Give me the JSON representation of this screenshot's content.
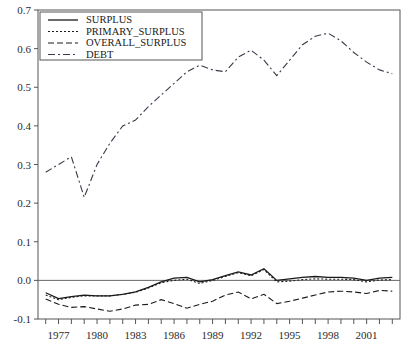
{
  "chart_data": {
    "type": "line",
    "title": "",
    "xlabel": "",
    "ylabel": "",
    "xlim": [
      1975.4,
      2003.6
    ],
    "ylim": [
      -0.1,
      0.7
    ],
    "grid": false,
    "legend_position": "top-left",
    "y_ticks": [
      "0.7",
      "0.6",
      "0.5",
      "0.4",
      "0.3",
      "0.2",
      "0.1",
      "0.0",
      "-0.1"
    ],
    "y_tick_values": [
      0.7,
      0.6,
      0.5,
      0.4,
      0.3,
      0.2,
      0.1,
      0.0,
      -0.1
    ],
    "x_tick_labels": [
      "1977",
      "1980",
      "1983",
      "1986",
      "1989",
      "1992",
      "1995",
      "1998",
      "2001"
    ],
    "x_tick_values": [
      1977,
      1980,
      1983,
      1986,
      1989,
      1992,
      1995,
      1998,
      2001
    ],
    "x_minor_ticks": [
      1976,
      1977,
      1978,
      1979,
      1980,
      1981,
      1982,
      1983,
      1984,
      1985,
      1986,
      1987,
      1988,
      1989,
      1990,
      1991,
      1992,
      1993,
      1994,
      1995,
      1996,
      1997,
      1998,
      1999,
      2000,
      2001,
      2002,
      2003
    ],
    "x": [
      1976,
      1977,
      1978,
      1979,
      1980,
      1981,
      1982,
      1983,
      1984,
      1985,
      1986,
      1987,
      1988,
      1989,
      1990,
      1991,
      1992,
      1993,
      1994,
      1995,
      1996,
      1997,
      1998,
      1999,
      2000,
      2001,
      2002,
      2003
    ],
    "zero_line": 0.0,
    "series": [
      {
        "name": "SURPLUS",
        "style": "solid",
        "color": "#1a1a1a",
        "values": [
          -0.032,
          -0.047,
          -0.042,
          -0.038,
          -0.04,
          -0.04,
          -0.036,
          -0.03,
          -0.018,
          -0.004,
          0.006,
          0.008,
          -0.004,
          0.002,
          0.012,
          0.022,
          0.014,
          0.03,
          0.0,
          0.004,
          0.008,
          0.01,
          0.008,
          0.008,
          0.006,
          0.0,
          0.006,
          0.008
        ]
      },
      {
        "name": "PRIMARY_SURPLUS",
        "style": "dotted",
        "color": "#1a1a1a",
        "values": [
          -0.038,
          -0.05,
          -0.044,
          -0.04,
          -0.04,
          -0.04,
          -0.036,
          -0.031,
          -0.02,
          -0.006,
          0.0,
          0.003,
          -0.008,
          0.0,
          0.01,
          0.02,
          0.012,
          0.028,
          -0.004,
          -0.002,
          0.002,
          0.004,
          0.003,
          0.003,
          0.002,
          -0.004,
          0.001,
          0.002
        ]
      },
      {
        "name": "OVERALL_SURPLUS",
        "style": "dashed",
        "color": "#1a1a1a",
        "values": [
          -0.048,
          -0.062,
          -0.07,
          -0.068,
          -0.074,
          -0.08,
          -0.074,
          -0.064,
          -0.062,
          -0.05,
          -0.06,
          -0.072,
          -0.062,
          -0.054,
          -0.038,
          -0.03,
          -0.048,
          -0.036,
          -0.06,
          -0.054,
          -0.046,
          -0.038,
          -0.03,
          -0.028,
          -0.03,
          -0.034,
          -0.026,
          -0.028
        ]
      },
      {
        "name": "DEBT",
        "style": "dashdot",
        "color": "#3a3a4a",
        "values": [
          0.28,
          0.3,
          0.32,
          0.215,
          0.3,
          0.355,
          0.4,
          0.415,
          0.45,
          0.48,
          0.51,
          0.54,
          0.557,
          0.545,
          0.54,
          0.578,
          0.596,
          0.57,
          0.53,
          0.57,
          0.61,
          0.632,
          0.64,
          0.62,
          0.59,
          0.565,
          0.545,
          0.535
        ]
      }
    ],
    "legend": [
      {
        "label": "SURPLUS",
        "style": "solid"
      },
      {
        "label": "PRIMARY_SURPLUS",
        "style": "dotted"
      },
      {
        "label": "OVERALL_SURPLUS",
        "style": "dashed"
      },
      {
        "label": "DEBT",
        "style": "dashdot"
      }
    ]
  }
}
